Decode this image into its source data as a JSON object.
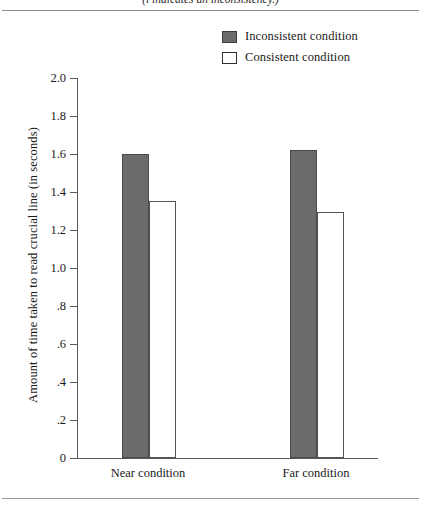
{
  "figure": {
    "clipped_caption": "(l indicates an inconsistency.)",
    "background_color": "#ffffff"
  },
  "legend": {
    "position": "top-right",
    "entries": [
      {
        "label": "Inconsistent condition",
        "swatch": "dark-gray-filled-square",
        "color": "#6b6b6b"
      },
      {
        "label": "Consistent condition",
        "swatch": "white-outlined-square",
        "color": "#ffffff"
      }
    ]
  },
  "axes": {
    "y_title": "Amount of time taken to read crucial line (in seconds)",
    "y_ticks": [
      "2.0",
      "1.8",
      "1.6",
      "1.4",
      "1.2",
      "1.0",
      ".8",
      ".6",
      ".4",
      ".2",
      "0"
    ],
    "y_tick_values": [
      2.0,
      1.8,
      1.6,
      1.4,
      1.2,
      1.0,
      0.8,
      0.6,
      0.4,
      0.2,
      0
    ],
    "x_title": "",
    "x_categories": [
      "Near condition",
      "Far condition"
    ]
  },
  "chart_data": {
    "type": "bar",
    "title": "",
    "subtitle": "",
    "xlabel": "",
    "ylabel": "Amount of time taken to read crucial line (in seconds)",
    "categories": [
      "Near condition",
      "Far condition"
    ],
    "series": [
      {
        "name": "Inconsistent condition",
        "values": [
          1.6,
          1.62
        ],
        "color": "#6b6b6b"
      },
      {
        "name": "Consistent condition",
        "values": [
          1.355,
          1.295
        ],
        "color": "#ffffff"
      }
    ],
    "ylim": [
      0,
      2.0
    ],
    "ytick_step": 0.2,
    "ytick_labels": [
      "0",
      ".2",
      ".4",
      ".6",
      ".8",
      "1.0",
      "1.2",
      "1.4",
      "1.6",
      "1.8",
      "2.0"
    ],
    "grid": false,
    "legend_position": "top-right",
    "annotations": []
  }
}
